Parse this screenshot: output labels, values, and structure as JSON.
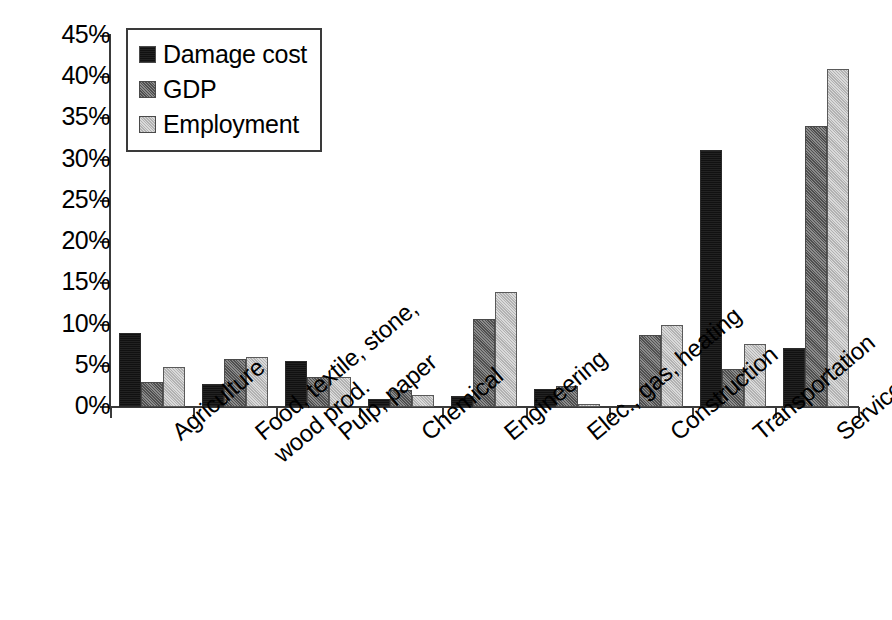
{
  "chart_data": {
    "type": "bar",
    "title": "",
    "xlabel": "",
    "ylabel": "",
    "ylim": [
      0,
      45
    ],
    "ytick_values": [
      0,
      5,
      10,
      15,
      20,
      25,
      30,
      35,
      40,
      45
    ],
    "ytick_labels": [
      "0%",
      "5%",
      "10%",
      "15%",
      "20%",
      "25%",
      "30%",
      "35%",
      "40%",
      "45%"
    ],
    "grid": false,
    "legend_position": "upper-left-inside",
    "value_unit": "%",
    "categories": [
      "Agriculture",
      "Food, textile, stone, wood prod.",
      "Pulp, paper",
      "Chemical",
      "Engineering",
      "Elec., gas, heating",
      "Construction",
      "Transportation",
      "Services"
    ],
    "category_lines": [
      [
        "Agriculture"
      ],
      [
        "Food, textile, stone,",
        "wood prod."
      ],
      [
        "Pulp, paper"
      ],
      [
        "Chemical"
      ],
      [
        "Engineering"
      ],
      [
        "Elec., gas, heating"
      ],
      [
        "Construction"
      ],
      [
        "Transportation"
      ],
      [
        "Services"
      ]
    ],
    "series": [
      {
        "name": "Damage cost",
        "color": "#111111",
        "values": [
          9.0,
          2.8,
          5.6,
          1.0,
          1.3,
          2.2,
          0.3,
          31.2,
          7.2
        ]
      },
      {
        "name": "GDP",
        "color": "#6e6e6e",
        "values": [
          3.0,
          5.8,
          3.6,
          2.1,
          10.7,
          2.6,
          8.7,
          4.6,
          34.1
        ]
      },
      {
        "name": "Employment",
        "color": "#cccccc",
        "values": [
          4.8,
          6.1,
          3.7,
          1.5,
          14.0,
          0.4,
          9.9,
          7.7,
          41.0
        ]
      }
    ]
  },
  "legend": {
    "items": [
      {
        "label": "Damage cost"
      },
      {
        "label": "GDP"
      },
      {
        "label": "Employment"
      }
    ]
  }
}
